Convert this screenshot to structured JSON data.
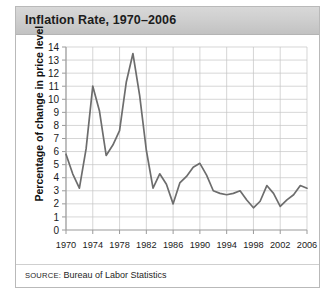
{
  "figure": {
    "title": "Inflation Rate, 1970–2006",
    "source_prefix": "SOURCE:",
    "source_body": " Bureau of Labor Statistics"
  },
  "colors": {
    "line": "#6d6d6d",
    "grid": "#c4c4c4",
    "axis": "#9a9a9a",
    "title_bar_top": "#d8d8d8",
    "title_bar_bottom": "#c2c2c2",
    "frame_border": "#b9b9b9",
    "text": "#1a1a1a"
  },
  "chart_data": {
    "type": "line",
    "title": "Inflation Rate, 1970–2006",
    "xlabel": "",
    "ylabel": "Percentage of change in price level",
    "xlim": [
      1970,
      2006
    ],
    "ylim": [
      0,
      14
    ],
    "ytick_step": 1,
    "xtick_step": 4,
    "grid": true,
    "legend": false,
    "yticks": [
      0,
      1,
      2,
      3,
      4,
      5,
      6,
      7,
      8,
      9,
      10,
      11,
      12,
      13,
      14
    ],
    "xticks": [
      1970,
      1974,
      1978,
      1982,
      1986,
      1990,
      1994,
      1998,
      2002,
      2006
    ],
    "x": [
      1970,
      1971,
      1972,
      1973,
      1974,
      1975,
      1976,
      1977,
      1978,
      1979,
      1980,
      1981,
      1982,
      1983,
      1984,
      1985,
      1986,
      1987,
      1988,
      1989,
      1990,
      1991,
      1992,
      1993,
      1994,
      1995,
      1996,
      1997,
      1998,
      1999,
      2000,
      2001,
      2002,
      2003,
      2004,
      2005,
      2006
    ],
    "values": [
      5.8,
      4.3,
      3.2,
      6.2,
      11.0,
      9.1,
      5.7,
      6.5,
      7.6,
      11.3,
      13.5,
      10.3,
      6.1,
      3.2,
      4.3,
      3.5,
      2.0,
      3.6,
      4.1,
      4.8,
      5.1,
      4.2,
      3.0,
      2.8,
      2.7,
      2.8,
      3.0,
      2.3,
      1.7,
      2.2,
      3.4,
      2.8,
      1.8,
      2.3,
      2.7,
      3.4,
      3.2
    ],
    "series_name": "Inflation rate",
    "units": "percent",
    "source": "SOURCE: Bureau of Labor Statistics"
  }
}
